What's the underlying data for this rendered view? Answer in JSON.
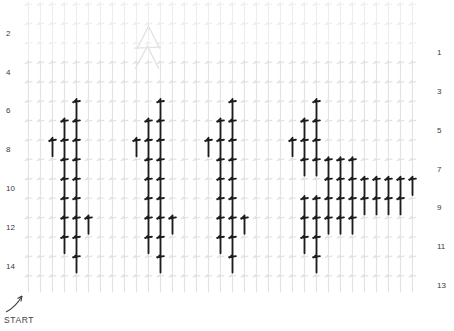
{
  "chart": {
    "title": "",
    "type": "crochet-stitch-chart",
    "start_label": "START",
    "start_arrow": "arrow-up-right-icon",
    "row_numbers_left": [
      "14",
      "12",
      "10",
      "8",
      "6",
      "4",
      "2"
    ],
    "row_numbers_right": [
      "13",
      "11",
      "9",
      "7",
      "5",
      "3",
      "1"
    ],
    "colors": {
      "background": "#ffffff",
      "grid_stitch": "#e2e2e2",
      "grid_stitch_faint": "#eeeeee",
      "highlight_stitch": "#1d1d1d",
      "label_text": "#3a3a3a"
    },
    "geometry": {
      "columns": 33,
      "rows": 15,
      "col_step": 12.0,
      "row_step": 19.4,
      "origin_x": 28.5,
      "origin_y": 292.0
    },
    "legend": {
      "grid_symbol": "double-crochet-stitch",
      "highlight_symbol": "front-post-double-crochet-stitch",
      "peak_symbol": "decrease-cluster-symbol"
    },
    "peak": {
      "name": "decrease-cluster-symbol",
      "col": 11.0,
      "row": 14.6
    },
    "highlight_cells": [
      {
        "col": 5,
        "row": 2
      },
      {
        "col": 5,
        "row": 3
      },
      {
        "col": 4,
        "row": 3
      },
      {
        "col": 4,
        "row": 4
      },
      {
        "col": 5,
        "row": 4
      },
      {
        "col": 6,
        "row": 4
      },
      {
        "col": 4,
        "row": 5
      },
      {
        "col": 5,
        "row": 5
      },
      {
        "col": 4,
        "row": 6
      },
      {
        "col": 5,
        "row": 6
      },
      {
        "col": 4,
        "row": 7
      },
      {
        "col": 5,
        "row": 7
      },
      {
        "col": 3,
        "row": 8
      },
      {
        "col": 4,
        "row": 8
      },
      {
        "col": 5,
        "row": 8
      },
      {
        "col": 4,
        "row": 9
      },
      {
        "col": 5,
        "row": 9
      },
      {
        "col": 5,
        "row": 10
      },
      {
        "col": 12,
        "row": 2
      },
      {
        "col": 12,
        "row": 3
      },
      {
        "col": 11,
        "row": 3
      },
      {
        "col": 11,
        "row": 4
      },
      {
        "col": 12,
        "row": 4
      },
      {
        "col": 13,
        "row": 4
      },
      {
        "col": 11,
        "row": 5
      },
      {
        "col": 12,
        "row": 5
      },
      {
        "col": 11,
        "row": 6
      },
      {
        "col": 12,
        "row": 6
      },
      {
        "col": 11,
        "row": 7
      },
      {
        "col": 12,
        "row": 7
      },
      {
        "col": 10,
        "row": 8
      },
      {
        "col": 11,
        "row": 8
      },
      {
        "col": 12,
        "row": 8
      },
      {
        "col": 11,
        "row": 9
      },
      {
        "col": 12,
        "row": 9
      },
      {
        "col": 12,
        "row": 10
      },
      {
        "col": 18,
        "row": 2
      },
      {
        "col": 18,
        "row": 3
      },
      {
        "col": 17,
        "row": 3
      },
      {
        "col": 17,
        "row": 4
      },
      {
        "col": 18,
        "row": 4
      },
      {
        "col": 19,
        "row": 4
      },
      {
        "col": 17,
        "row": 5
      },
      {
        "col": 18,
        "row": 5
      },
      {
        "col": 17,
        "row": 6
      },
      {
        "col": 18,
        "row": 6
      },
      {
        "col": 17,
        "row": 7
      },
      {
        "col": 18,
        "row": 7
      },
      {
        "col": 16,
        "row": 8
      },
      {
        "col": 17,
        "row": 8
      },
      {
        "col": 18,
        "row": 8
      },
      {
        "col": 17,
        "row": 9
      },
      {
        "col": 18,
        "row": 9
      },
      {
        "col": 18,
        "row": 10
      },
      {
        "col": 25,
        "row": 2
      },
      {
        "col": 25,
        "row": 3
      },
      {
        "col": 24,
        "row": 3
      },
      {
        "col": 24,
        "row": 4
      },
      {
        "col": 25,
        "row": 4
      },
      {
        "col": 26,
        "row": 4
      },
      {
        "col": 27,
        "row": 4
      },
      {
        "col": 28,
        "row": 4
      },
      {
        "col": 24,
        "row": 5
      },
      {
        "col": 25,
        "row": 5
      },
      {
        "col": 26,
        "row": 5
      },
      {
        "col": 27,
        "row": 5
      },
      {
        "col": 28,
        "row": 5
      },
      {
        "col": 29,
        "row": 5
      },
      {
        "col": 30,
        "row": 5
      },
      {
        "col": 31,
        "row": 5
      },
      {
        "col": 32,
        "row": 5
      },
      {
        "col": 26,
        "row": 6
      },
      {
        "col": 27,
        "row": 6
      },
      {
        "col": 28,
        "row": 6
      },
      {
        "col": 29,
        "row": 6
      },
      {
        "col": 30,
        "row": 6
      },
      {
        "col": 31,
        "row": 6
      },
      {
        "col": 32,
        "row": 6
      },
      {
        "col": 33,
        "row": 6
      },
      {
        "col": 24,
        "row": 7
      },
      {
        "col": 25,
        "row": 7
      },
      {
        "col": 26,
        "row": 7
      },
      {
        "col": 27,
        "row": 7
      },
      {
        "col": 28,
        "row": 7
      },
      {
        "col": 23,
        "row": 8
      },
      {
        "col": 24,
        "row": 8
      },
      {
        "col": 25,
        "row": 8
      },
      {
        "col": 24,
        "row": 9
      },
      {
        "col": 25,
        "row": 9
      },
      {
        "col": 25,
        "row": 10
      }
    ]
  },
  "chart_data": {
    "type": "heatmap",
    "xlabel": "Stitch column",
    "ylabel": "Row",
    "categories": [
      1,
      2,
      3,
      4,
      5,
      6,
      7,
      8,
      9,
      10,
      11,
      12,
      13,
      14,
      15,
      16,
      17,
      18,
      19,
      20,
      21,
      22,
      23,
      24,
      25,
      26,
      27,
      28,
      29,
      30,
      31,
      32,
      33
    ],
    "row_labels": [
      "1",
      "2",
      "3",
      "4",
      "5",
      "6",
      "7",
      "8",
      "9",
      "10",
      "11",
      "12",
      "13",
      "14"
    ],
    "legend_position": "none",
    "grid": true,
    "series": [
      {
        "name": "background stitches",
        "color": "#e2e2e2"
      },
      {
        "name": "highlighted post stitches",
        "color": "#1d1d1d"
      }
    ]
  }
}
